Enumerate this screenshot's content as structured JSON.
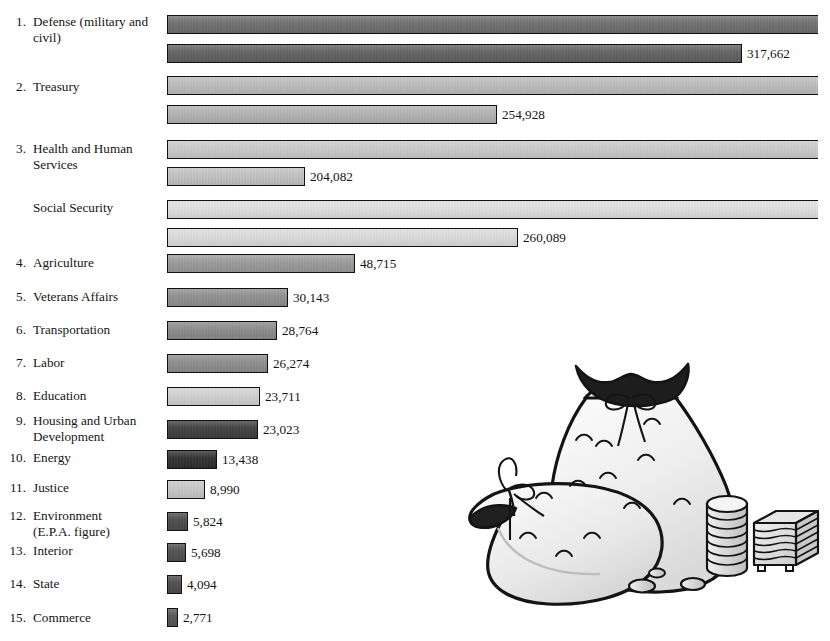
{
  "chart_data": {
    "type": "bar",
    "title": "",
    "subtitle": "",
    "xlabel": "",
    "ylabel": "",
    "orientation": "horizontal",
    "grid": false,
    "legend": null,
    "note": "Each department shows two stacked horizontal bars; only the lower (shorter) bar carries a printed value label. The upper bars of the first four departments run off the right edge of the figure.",
    "categories": [
      "Defense (military and civil)",
      "Treasury",
      "Health and Human Services",
      "Social Security",
      "Agriculture",
      "Veterans Affairs",
      "Transportation",
      "Labor",
      "Education",
      "Housing and Urban Development",
      "Energy",
      "Justice",
      "Environment (E.P.A. figure)",
      "Interior",
      "State",
      "Commerce"
    ],
    "values": [
      317662,
      254928,
      204082,
      260089,
      48715,
      30143,
      28764,
      26274,
      23711,
      23023,
      13438,
      8990,
      5824,
      5698,
      4094,
      2771
    ],
    "value_labels": [
      "317,662",
      "254,928",
      "204,082",
      "260,089",
      "48,715",
      "30,143",
      "28,764",
      "26,274",
      "23,711",
      "23,023",
      "13,438",
      "8,990",
      "5,824",
      "5,698",
      "4,094",
      "2,771"
    ],
    "xlim": [
      0,
      360000
    ]
  },
  "rows": [
    {
      "number": "1.",
      "label": "Defense (military and\ncivil)",
      "label_line1": "Defense (military and",
      "label_line2": "civil)",
      "label_top": 14,
      "label_lines": 2,
      "bars": [
        {
          "top": 15,
          "width": 651,
          "color": "#6e6e6e",
          "value": null,
          "clipped": true
        },
        {
          "top": 44,
          "width": 575,
          "color": "#606060",
          "value": "317,662",
          "clipped": false
        }
      ]
    },
    {
      "number": "2.",
      "label": "Treasury",
      "label_line1": "Treasury",
      "label_line2": "",
      "label_top": 79,
      "label_lines": 1,
      "bars": [
        {
          "top": 76,
          "width": 651,
          "color": "#bdbdbd",
          "value": null,
          "clipped": true
        },
        {
          "top": 105,
          "width": 330,
          "color": "#b2b2b2",
          "value": "254,928",
          "clipped": false
        }
      ]
    },
    {
      "number": "3.",
      "label": "Health and Human\nServices",
      "label_line1": "Health and Human",
      "label_line2": "Services",
      "label_top": 141,
      "label_lines": 2,
      "bars": [
        {
          "top": 140,
          "width": 651,
          "color": "#cbcbcb",
          "value": null,
          "clipped": true
        },
        {
          "top": 167,
          "width": 138,
          "color": "#c2c2c2",
          "value": "204,082",
          "clipped": false
        }
      ]
    },
    {
      "number": "",
      "label": "Social Security",
      "label_line1": "Social Security",
      "label_line2": "",
      "label_top": 200,
      "label_lines": 1,
      "bars": [
        {
          "top": 200,
          "width": 651,
          "color": "#e0e0e0",
          "value": null,
          "clipped": true
        },
        {
          "top": 228,
          "width": 351,
          "color": "#dcdcdc",
          "value": "260,089",
          "clipped": false
        }
      ]
    },
    {
      "number": "4.",
      "label": "Agriculture",
      "label_line1": "Agriculture",
      "label_line2": "",
      "label_top": 255,
      "label_lines": 1,
      "bars": [
        {
          "top": 254,
          "width": 188,
          "color": "#9a9a9a",
          "value": "48,715",
          "clipped": false
        }
      ]
    },
    {
      "number": "5.",
      "label": "Veterans Affairs",
      "label_line1": "Veterans Affairs",
      "label_line2": "",
      "label_top": 289,
      "label_lines": 1,
      "bars": [
        {
          "top": 288,
          "width": 121,
          "color": "#8f8f8f",
          "value": "30,143",
          "clipped": false
        }
      ]
    },
    {
      "number": "6.",
      "label": "Transportation",
      "label_line1": "Transportation",
      "label_line2": "",
      "label_top": 322,
      "label_lines": 1,
      "bars": [
        {
          "top": 321,
          "width": 110,
          "color": "#8a8a8a",
          "value": "28,764",
          "clipped": false
        }
      ]
    },
    {
      "number": "7.",
      "label": "Labor",
      "label_line1": "Labor",
      "label_line2": "",
      "label_top": 355,
      "label_lines": 1,
      "bars": [
        {
          "top": 354,
          "width": 101,
          "color": "#8d8d8d",
          "value": "26,274",
          "clipped": false
        }
      ]
    },
    {
      "number": "8.",
      "label": "Education",
      "label_line1": "Education",
      "label_line2": "",
      "label_top": 388,
      "label_lines": 1,
      "bars": [
        {
          "top": 387,
          "width": 93,
          "color": "#d2d2d2",
          "value": "23,711",
          "clipped": false
        }
      ]
    },
    {
      "number": "9.",
      "label": "Housing and Urban\nDevelopment",
      "label_line1": "Housing and Urban",
      "label_line2": "Development",
      "label_top": 413,
      "label_lines": 2,
      "bars": [
        {
          "top": 420,
          "width": 91,
          "color": "#3e3e3e",
          "value": "23,023",
          "clipped": false
        }
      ]
    },
    {
      "number": "10.",
      "label": "Energy",
      "label_line1": "Energy",
      "label_line2": "",
      "label_top": 450,
      "label_lines": 1,
      "bars": [
        {
          "top": 450,
          "width": 50,
          "color": "#2e2e2e",
          "value": "13,438",
          "clipped": false
        }
      ]
    },
    {
      "number": "11.",
      "label": "Justice",
      "label_line1": "Justice",
      "label_line2": "",
      "label_top": 480,
      "label_lines": 1,
      "bars": [
        {
          "top": 480,
          "width": 38,
          "color": "#c8c8c8",
          "value": "8,990",
          "clipped": false
        }
      ]
    },
    {
      "number": "12.",
      "label": "Environment\n(E.P.A. figure)",
      "label_line1": "Environment",
      "label_line2": "(E.P.A. figure)",
      "label_top": 508,
      "label_lines": 2,
      "bars": [
        {
          "top": 512,
          "width": 21,
          "color": "#4a4a4a",
          "value": "5,824",
          "clipped": false
        }
      ]
    },
    {
      "number": "13.",
      "label": "Interior",
      "label_line1": "Interior",
      "label_line2": "",
      "label_top": 543,
      "label_lines": 1,
      "bars": [
        {
          "top": 543,
          "width": 19,
          "color": "#4f4f4f",
          "value": "5,698",
          "clipped": false
        }
      ]
    },
    {
      "number": "14.",
      "label": "State",
      "label_line1": "State",
      "label_line2": "",
      "label_top": 576,
      "label_lines": 1,
      "bars": [
        {
          "top": 575,
          "width": 15,
          "color": "#4b4b4b",
          "value": "4,094",
          "clipped": false
        }
      ]
    },
    {
      "number": "15.",
      "label": "Commerce",
      "label_line1": "Commerce",
      "label_line2": "",
      "label_top": 610,
      "label_lines": 1,
      "bars": [
        {
          "top": 608,
          "width": 11,
          "color": "#555555",
          "value": "2,771",
          "clipped": false
        }
      ]
    }
  ],
  "illustration": {
    "name": "money-bags-coins-and-bills-illustration",
    "description": "Line drawing of two tied money sacks with a stack of coins, loose coins, and a stack of banknotes"
  }
}
